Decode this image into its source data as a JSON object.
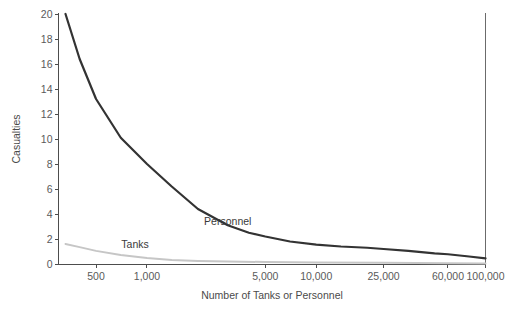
{
  "chart_data": {
    "type": "line",
    "title": "",
    "xlabel": "Number of Tanks or Personnel",
    "ylabel": "Casualties",
    "xscale": "log",
    "xlim": [
      300,
      100000
    ],
    "ylim": [
      0,
      20
    ],
    "grid": false,
    "legend_position": "inline-annotations",
    "xticks": [
      500,
      1000,
      5000,
      10000,
      25000,
      60000,
      100000
    ],
    "xtick_labels": [
      "500",
      "1,000",
      "5,000",
      "10,000",
      "25,000",
      "60,000",
      "100,000"
    ],
    "yticks": [
      0,
      2,
      4,
      6,
      8,
      10,
      12,
      14,
      16,
      18,
      20
    ],
    "ytick_labels": [
      "0",
      "2",
      "4",
      "6",
      "8",
      "10",
      "12",
      "14",
      "16",
      "18",
      "20"
    ],
    "series": [
      {
        "name": "Personnel",
        "color": "#333333",
        "width": 2.2,
        "label_x": 3000,
        "label_y": 3.1,
        "x": [
          330,
          400,
          500,
          700,
          1000,
          1400,
          2000,
          3000,
          4000,
          5000,
          7000,
          10000,
          14000,
          20000,
          25000,
          35000,
          50000,
          60000,
          80000,
          100000
        ],
        "y": [
          20.0,
          16.4,
          13.2,
          10.1,
          8.0,
          6.2,
          4.4,
          3.1,
          2.5,
          2.2,
          1.8,
          1.55,
          1.4,
          1.3,
          1.2,
          1.05,
          0.85,
          0.78,
          0.6,
          0.45
        ]
      },
      {
        "name": "Tanks",
        "color": "#c6c6c6",
        "width": 2.0,
        "label_x": 850,
        "label_y": 1.25,
        "x": [
          330,
          400,
          500,
          700,
          1000,
          1400,
          2000,
          3000,
          5000,
          10000,
          25000,
          60000,
          100000
        ],
        "y": [
          1.6,
          1.35,
          1.05,
          0.72,
          0.48,
          0.33,
          0.25,
          0.2,
          0.16,
          0.13,
          0.1,
          0.07,
          0.05
        ]
      }
    ],
    "annotations": [
      {
        "text": "Personnel",
        "x": 3000,
        "y": 3.1
      },
      {
        "text": "Tanks",
        "x": 850,
        "y": 1.25
      }
    ],
    "right_border_line": {
      "at_x": 100000,
      "color": "#6b6b6b"
    }
  },
  "axes": {
    "y_title": "Casualties",
    "x_title": "Number of Tanks or Personnel"
  }
}
